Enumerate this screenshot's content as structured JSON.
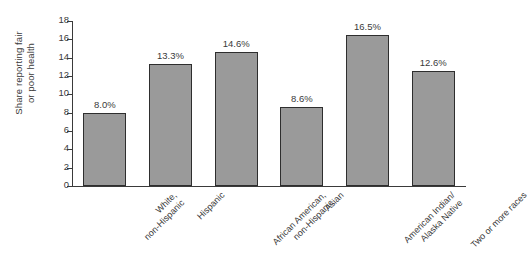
{
  "chart_data": {
    "type": "bar",
    "title": "",
    "subtitle": "",
    "xlabel": "",
    "ylabel": "Share reporting fair or poor health",
    "ylabel_lines": [
      "Share reporting fair",
      "or poor health"
    ],
    "categories": [
      "White, non-Hispanic",
      "Hispanic",
      "African American, non-Hispanic",
      "Asian",
      "American Indian/ Alaska Native",
      "Two or more races"
    ],
    "category_lines": [
      [
        "White,",
        "non-Hispanic"
      ],
      [
        "Hispanic"
      ],
      [
        "African American,",
        "non-Hispanic"
      ],
      [
        "Asian"
      ],
      [
        "American Indian/",
        "Alaska Native"
      ],
      [
        "Two or more races"
      ]
    ],
    "values": [
      8.0,
      13.3,
      14.6,
      8.6,
      16.5,
      12.6
    ],
    "data_labels": [
      "8.0%",
      "13.3%",
      "14.6%",
      "8.6%",
      "16.5%",
      "12.6%"
    ],
    "ylim": [
      0,
      18
    ],
    "ytick_values": [
      0,
      2,
      4,
      6,
      8,
      10,
      12,
      14,
      16,
      18
    ],
    "ytick_labels": [
      "0",
      "2",
      "4",
      "6",
      "8",
      "10",
      "12",
      "14",
      "16",
      "18"
    ],
    "grid": false,
    "legend": false,
    "legend_position": "none",
    "bar_fill_color": "#9a9a9a",
    "bar_edge_color": "#2e2e2e",
    "axis_color": "#3a3a3a",
    "background_color": "#ffffff"
  }
}
